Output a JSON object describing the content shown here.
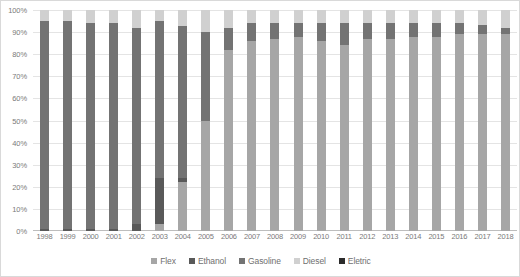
{
  "chart_data": {
    "type": "bar",
    "stacked": true,
    "title": "",
    "xlabel": "",
    "ylabel": "",
    "ylim": [
      0,
      100
    ],
    "grid": true,
    "legend_position": "bottom",
    "categories": [
      "1998",
      "1999",
      "2000",
      "2001",
      "2002",
      "2003",
      "2004",
      "2005",
      "2006",
      "2007",
      "2008",
      "2009",
      "2010",
      "2011",
      "2012",
      "2013",
      "2014",
      "2015",
      "2016",
      "2017",
      "2018"
    ],
    "y_ticks": [
      "0%",
      "10%",
      "20%",
      "30%",
      "40%",
      "50%",
      "60%",
      "70%",
      "80%",
      "90%",
      "100%"
    ],
    "series": [
      {
        "name": "Flex",
        "color": "#a6a6a6",
        "values": [
          0,
          0,
          0,
          0,
          0,
          3,
          22,
          50,
          82,
          86,
          87,
          88,
          86,
          84,
          87,
          87,
          88,
          88,
          89,
          89,
          89
        ]
      },
      {
        "name": "Ethanol",
        "color": "#595959",
        "values": [
          1,
          1,
          1,
          1,
          3,
          21,
          2,
          0,
          0,
          0,
          0,
          0,
          0,
          0,
          0,
          0,
          0,
          0,
          0,
          0,
          0
        ]
      },
      {
        "name": "Gasoline",
        "color": "#737373",
        "values": [
          94,
          94,
          93,
          93,
          89,
          71,
          69,
          40,
          10,
          8,
          7,
          6,
          8,
          10,
          7,
          7,
          6,
          6,
          5,
          4,
          3
        ]
      },
      {
        "name": "Diesel",
        "color": "#d0d0d0",
        "values": [
          5,
          5,
          6,
          6,
          8,
          5,
          7,
          10,
          8,
          6,
          6,
          6,
          6,
          6,
          6,
          6,
          6,
          6,
          6,
          7,
          8
        ]
      },
      {
        "name": "Eletric",
        "color": "#2b2b2b",
        "values": [
          0,
          0,
          0,
          0,
          0,
          0,
          0,
          0,
          0,
          0,
          0,
          0,
          0,
          0,
          0,
          0,
          0,
          0,
          0,
          0,
          0
        ]
      }
    ]
  },
  "legend": {
    "items": [
      {
        "label": "Flex",
        "color": "#a6a6a6"
      },
      {
        "label": "Ethanol",
        "color": "#595959"
      },
      {
        "label": "Gasoline",
        "color": "#737373"
      },
      {
        "label": "Diesel",
        "color": "#d0d0d0"
      },
      {
        "label": "Eletric",
        "color": "#2b2b2b"
      }
    ]
  }
}
